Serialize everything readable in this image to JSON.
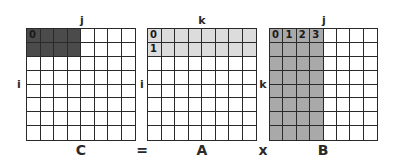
{
  "matrices": [
    {
      "name": "C",
      "top_label": "j",
      "side_label": "i",
      "shaded_cols": 4,
      "shaded_rows": 2,
      "fill": "#4b4b4b",
      "numbers": [
        {
          "row": 0,
          "col": 0,
          "text": "0"
        }
      ],
      "box": {
        "x": 26,
        "y": 28,
        "w": 110,
        "h": 113
      },
      "top_pos": [
        82,
        20
      ],
      "side_pos": [
        19,
        84
      ],
      "bottom_pos": [
        81,
        150
      ]
    },
    {
      "name": "A",
      "top_label": "k",
      "side_label": "i",
      "shaded_cols": 8,
      "shaded_rows": 2,
      "fill": "#dcdcdc",
      "numbers": [
        {
          "row": 0,
          "col": 0,
          "text": "0"
        },
        {
          "row": 1,
          "col": 0,
          "text": "1"
        }
      ],
      "box": {
        "x": 147,
        "y": 28,
        "w": 110,
        "h": 113
      },
      "top_pos": [
        202,
        20
      ],
      "side_pos": [
        142,
        84
      ],
      "bottom_pos": [
        202,
        150
      ]
    },
    {
      "name": "B",
      "top_label": "j",
      "side_label": "k",
      "shaded_cols": 4,
      "shaded_rows": 8,
      "fill": "#a9a9a9",
      "numbers": [
        {
          "row": 0,
          "col": 0,
          "text": "0"
        },
        {
          "row": 0,
          "col": 1,
          "text": "1"
        },
        {
          "row": 0,
          "col": 2,
          "text": "2"
        },
        {
          "row": 0,
          "col": 3,
          "text": "3"
        }
      ],
      "box": {
        "x": 269,
        "y": 28,
        "w": 109,
        "h": 113
      },
      "top_pos": [
        324,
        20
      ],
      "side_pos": [
        263,
        84
      ],
      "bottom_pos": [
        323,
        150
      ]
    }
  ],
  "operators": [
    {
      "text": "=",
      "pos": [
        142,
        150
      ]
    },
    {
      "text": "x",
      "pos": [
        263,
        150
      ]
    }
  ],
  "grid_size": 8
}
